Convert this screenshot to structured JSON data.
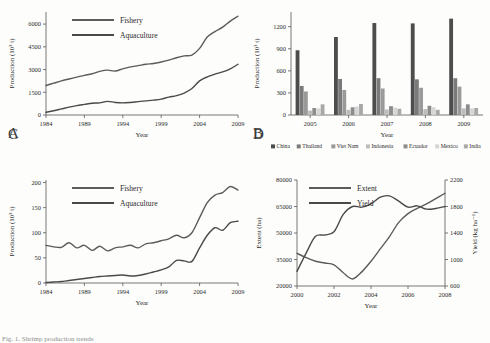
{
  "figure": {
    "caption": "Fig. 1. Shrimp production trends",
    "panel_letters": {
      "a": "A",
      "b": "B",
      "c": "C",
      "d": "D"
    }
  },
  "colors": {
    "fishery": "#5b5b5b",
    "aquaculture": "#4a4a4a",
    "extent": "#5b5b5b",
    "yield": "#4a4a4a",
    "axis": "#555555",
    "china": "#4d4d4d",
    "thailand": "#7a7a7a",
    "vietnam": "#9a9a9a",
    "indonesia": "#bdbdbd",
    "ecuador": "#8c8c8c",
    "mexico": "#d6d6d6",
    "india": "#a8a8a8"
  },
  "chart_data": [
    {
      "id": "panel_a",
      "type": "line",
      "title": "",
      "xlabel": "Year",
      "ylabel": "Production (10³ t)",
      "xlim": [
        1984,
        2009
      ],
      "ylim": [
        0,
        6800
      ],
      "yticks": [
        0,
        1500,
        3000,
        4500,
        6000
      ],
      "xticks": [
        1984,
        1989,
        1994,
        1999,
        2004,
        2009
      ],
      "grid": false,
      "legend_position": "top-left",
      "x": [
        1984,
        1985,
        1986,
        1987,
        1988,
        1989,
        1990,
        1991,
        1992,
        1993,
        1994,
        1995,
        1996,
        1997,
        1998,
        1999,
        2000,
        2001,
        2002,
        2003,
        2004,
        2005,
        2006,
        2007,
        2008,
        2009
      ],
      "series": [
        {
          "name": "Fishery",
          "values": [
            1950,
            2100,
            2250,
            2380,
            2500,
            2620,
            2720,
            2880,
            2960,
            2900,
            3050,
            3180,
            3260,
            3350,
            3400,
            3500,
            3620,
            3780,
            3900,
            3960,
            4400,
            5150,
            5500,
            5800,
            6200,
            6520
          ]
        },
        {
          "name": "Aquaculture",
          "values": [
            180,
            280,
            400,
            520,
            620,
            700,
            780,
            800,
            900,
            830,
            800,
            830,
            880,
            930,
            980,
            1050,
            1180,
            1280,
            1450,
            1750,
            2250,
            2520,
            2700,
            2850,
            3050,
            3350
          ]
        }
      ]
    },
    {
      "id": "panel_b",
      "type": "bar",
      "title": "",
      "xlabel": "Year",
      "ylabel": "Production (10³ t)",
      "ylim": [
        0,
        1400
      ],
      "yticks": [
        0,
        300,
        600,
        900,
        1200
      ],
      "categories": [
        "2005",
        "2006",
        "2007",
        "2008",
        "2009"
      ],
      "grid": false,
      "legend_position": "bottom",
      "series": [
        {
          "name": "China",
          "values": [
            880,
            1060,
            1250,
            1245,
            1310
          ]
        },
        {
          "name": "Thailand",
          "values": [
            395,
            490,
            500,
            485,
            500
          ]
        },
        {
          "name": "Viet Nam",
          "values": [
            320,
            340,
            360,
            370,
            385
          ]
        },
        {
          "name": "Indonesia",
          "values": [
            60,
            70,
            75,
            80,
            90
          ]
        },
        {
          "name": "Ecuador",
          "values": [
            95,
            105,
            120,
            125,
            145
          ]
        },
        {
          "name": "Mexico",
          "values": [
            90,
            115,
            100,
            105,
            90
          ]
        },
        {
          "name": "India",
          "values": [
            145,
            150,
            85,
            70,
            95
          ]
        }
      ]
    },
    {
      "id": "panel_c",
      "type": "line",
      "title": "",
      "xlabel": "Year",
      "ylabel": "Production (10³ t)",
      "xlim": [
        1984,
        2009
      ],
      "ylim": [
        0,
        205
      ],
      "yticks": [
        0,
        50,
        100,
        150,
        200
      ],
      "xticks": [
        1984,
        1989,
        1994,
        1999,
        2004,
        2009
      ],
      "grid": false,
      "legend_position": "top-left",
      "x": [
        1984,
        1985,
        1986,
        1987,
        1988,
        1989,
        1990,
        1991,
        1992,
        1993,
        1994,
        1995,
        1996,
        1997,
        1998,
        1999,
        2000,
        2001,
        2002,
        2003,
        2004,
        2005,
        2006,
        2007,
        2008,
        2009
      ],
      "series": [
        {
          "name": "Fishery",
          "values": [
            75,
            72,
            71,
            80,
            70,
            75,
            65,
            73,
            64,
            70,
            72,
            75,
            70,
            78,
            80,
            84,
            88,
            95,
            90,
            100,
            130,
            160,
            175,
            180,
            192,
            185
          ]
        },
        {
          "name": "Aquaculture",
          "values": [
            1,
            2,
            3,
            5,
            7,
            9,
            11,
            13,
            14,
            15,
            16,
            14,
            15,
            18,
            22,
            26,
            32,
            45,
            44,
            43,
            70,
            95,
            110,
            105,
            120,
            123
          ]
        }
      ]
    },
    {
      "id": "panel_d",
      "type": "line",
      "title": "",
      "xlabel": "Year",
      "ylabel_left": "Extent (ha)",
      "ylabel_right": "Yield (kg ha⁻¹)",
      "xlim": [
        2000,
        2008
      ],
      "ylim_left": [
        20000,
        80000
      ],
      "ylim_right": [
        600,
        2200
      ],
      "yticks_left": [
        20000,
        35000,
        50000,
        65000,
        80000
      ],
      "yticks_right": [
        600,
        1000,
        1400,
        1800,
        2200
      ],
      "xticks": [
        2000,
        2002,
        2004,
        2006,
        2008
      ],
      "grid": false,
      "legend_position": "top-left",
      "x": [
        2000,
        2000.5,
        2001,
        2001.5,
        2002,
        2002.5,
        2003,
        2003.5,
        2004,
        2004.5,
        2005,
        2005.5,
        2006,
        2006.5,
        2007,
        2007.5,
        2008
      ],
      "series": [
        {
          "name": "Extent",
          "axis": "left",
          "values": [
            38500,
            36000,
            34000,
            33000,
            32000,
            27500,
            24000,
            28000,
            34000,
            41000,
            48000,
            56000,
            61000,
            64000,
            66500,
            69500,
            72500
          ]
        },
        {
          "name": "Yield",
          "axis": "right",
          "values": [
            820,
            1100,
            1350,
            1370,
            1420,
            1680,
            1800,
            1790,
            1840,
            1940,
            1960,
            1880,
            1790,
            1810,
            1760,
            1770,
            1800
          ]
        }
      ]
    }
  ]
}
